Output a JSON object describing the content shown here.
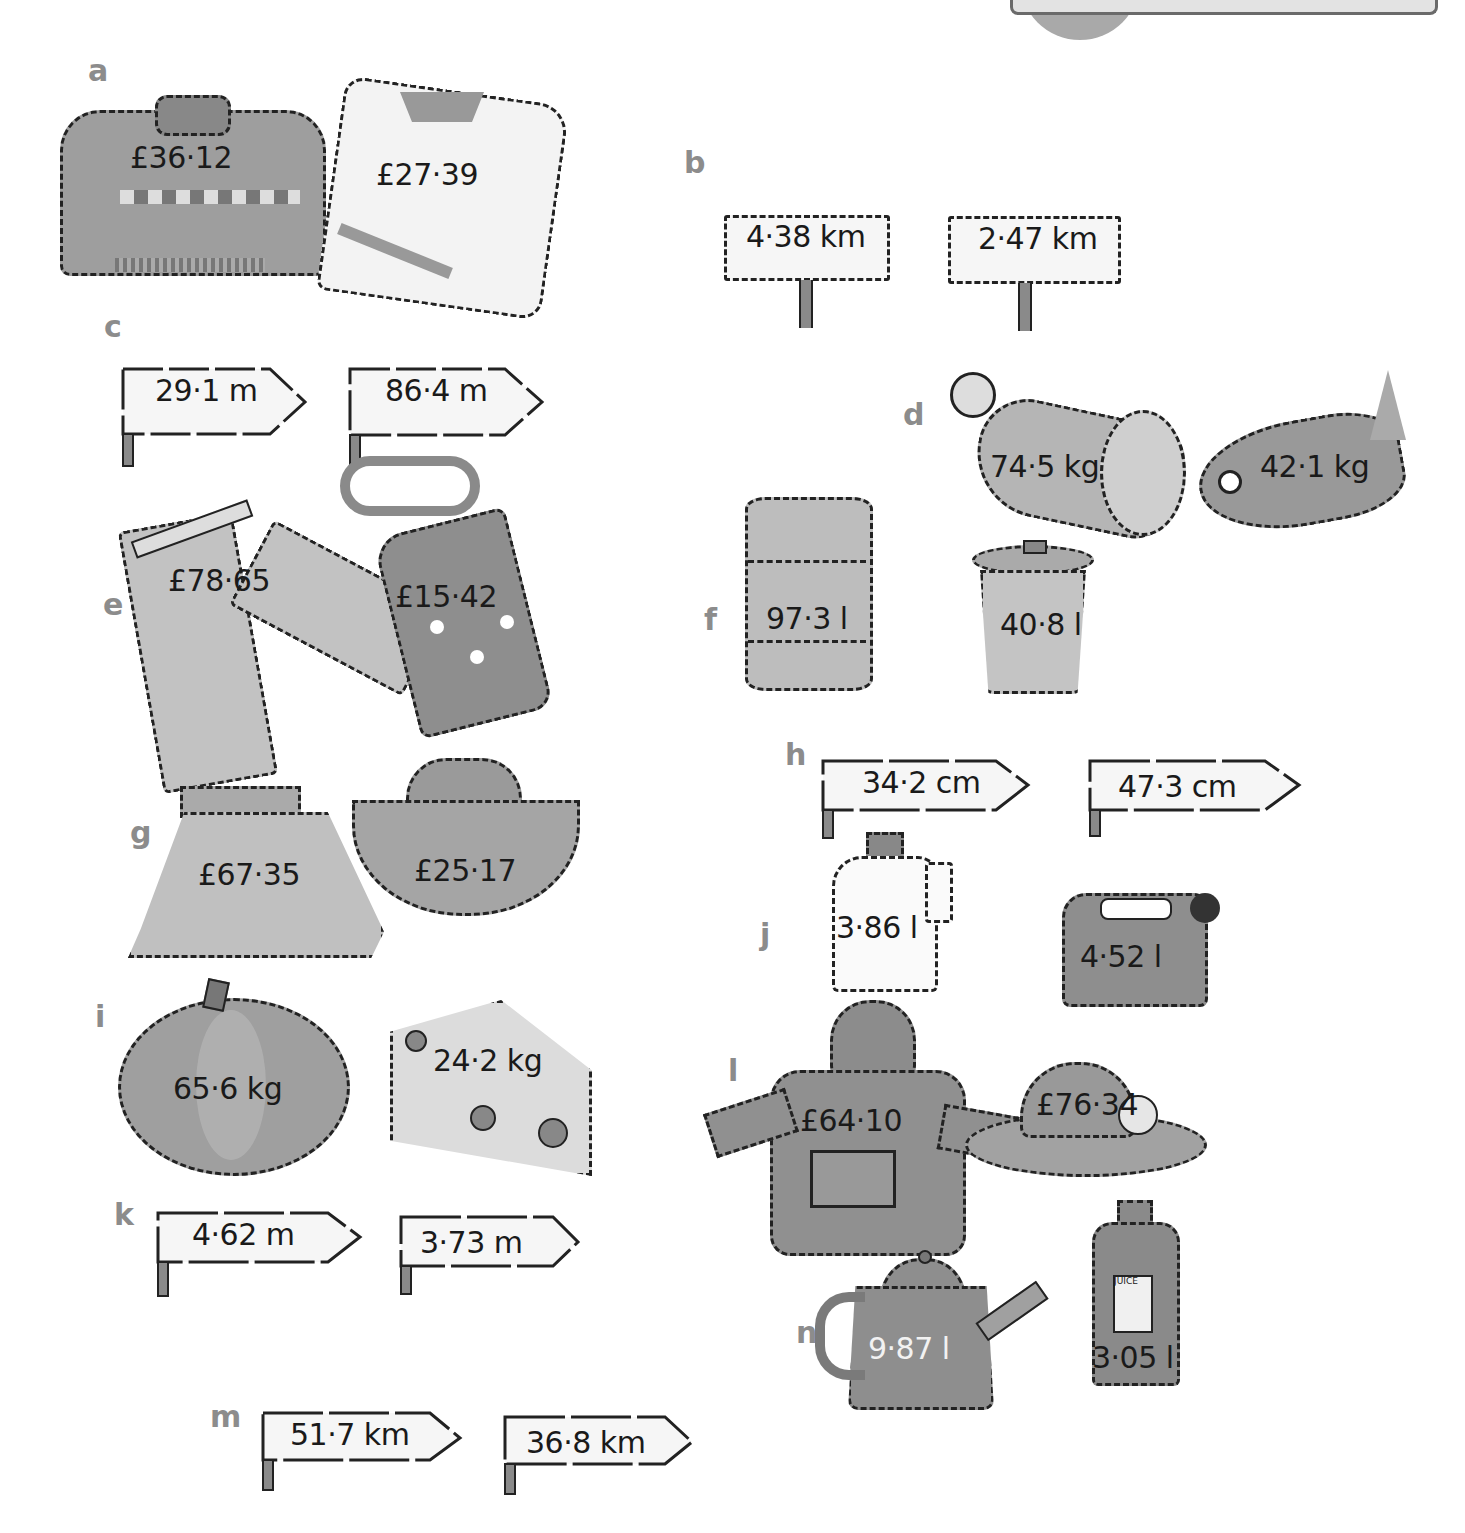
{
  "page": {
    "type": "textbook exercise page",
    "header_fragment_visible": true
  },
  "items": {
    "a": {
      "label": "a",
      "objects": [
        {
          "name": "jumper",
          "value": "£36·12"
        },
        {
          "name": "cricket-jumper",
          "value": "£27·39"
        }
      ]
    },
    "b": {
      "label": "b",
      "objects": [
        {
          "name": "signboard",
          "value": "4·38 km"
        },
        {
          "name": "signboard",
          "value": "2·47 km"
        }
      ]
    },
    "c": {
      "label": "c",
      "objects": [
        {
          "name": "signpost",
          "value": "29·1 m"
        },
        {
          "name": "signpost",
          "value": "86·4 m"
        }
      ]
    },
    "d": {
      "label": "d",
      "objects": [
        {
          "name": "ham",
          "value": "74·5 kg"
        },
        {
          "name": "fish",
          "value": "42·1 kg"
        }
      ]
    },
    "e": {
      "label": "e",
      "objects": [
        {
          "name": "trousers",
          "value": "£78·65"
        },
        {
          "name": "tie",
          "value": "£15·42"
        }
      ]
    },
    "f": {
      "label": "f",
      "objects": [
        {
          "name": "drum",
          "value": "97·3 l"
        },
        {
          "name": "bin",
          "value": "40·8 l"
        }
      ]
    },
    "g": {
      "label": "g",
      "objects": [
        {
          "name": "skirt",
          "value": "£67·35"
        },
        {
          "name": "cowboy-hat",
          "value": "£25·17"
        }
      ]
    },
    "h": {
      "label": "h",
      "objects": [
        {
          "name": "signpost",
          "value": "34·2 cm"
        },
        {
          "name": "signpost",
          "value": "47·3 cm"
        }
      ]
    },
    "i": {
      "label": "i",
      "objects": [
        {
          "name": "pumpkin",
          "value": "65·6 kg"
        },
        {
          "name": "cheese",
          "value": "24·2 kg"
        }
      ]
    },
    "j": {
      "label": "j",
      "objects": [
        {
          "name": "bottle",
          "value": "3·86 l"
        },
        {
          "name": "jerrycan",
          "value": "4·52 l"
        }
      ]
    },
    "k": {
      "label": "k",
      "objects": [
        {
          "name": "signpost",
          "value": "4·62 m"
        },
        {
          "name": "signpost",
          "value": "3·73 m"
        }
      ]
    },
    "l": {
      "label": "l",
      "objects": [
        {
          "name": "hooded-coat",
          "value": "£64·10"
        },
        {
          "name": "sun-hat",
          "value": "£76·34"
        }
      ]
    },
    "m": {
      "label": "m",
      "objects": [
        {
          "name": "signpost",
          "value": "51·7 km"
        },
        {
          "name": "signpost",
          "value": "36·8 km"
        }
      ]
    },
    "n": {
      "label": "n",
      "objects": [
        {
          "name": "teapot",
          "value": "9·87 l"
        },
        {
          "name": "juice-bottle",
          "value": "3·05 l",
          "label_text": "JUICE"
        }
      ]
    }
  }
}
